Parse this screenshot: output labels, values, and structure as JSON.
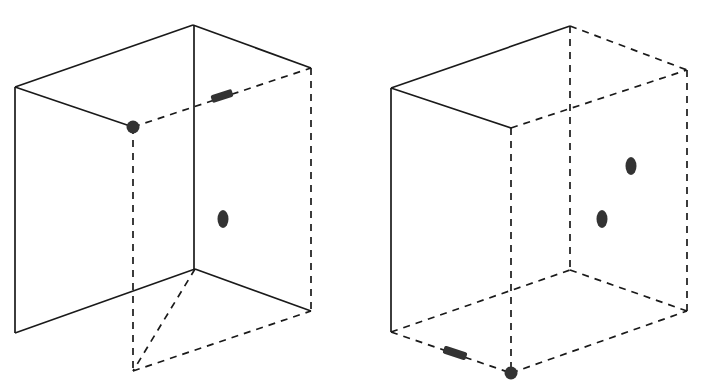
{
  "figure": {
    "title": "Two 3D wireframe rectangular boxes with point markers",
    "caption": "",
    "width": 712,
    "height": 392,
    "background_color": "#ffffff",
    "edge_color": "#1a1a1a",
    "marker_color": "#333333",
    "edge_stroke_width": 1.7,
    "dash_pattern": "7 6"
  },
  "panels": [
    {
      "id": "left-box",
      "label": "Left box",
      "description": "Wireframe box viewed from the left-front; near vertical edge at center, hidden back edges dashed",
      "vertices": {
        "top_front_left": [
          15,
          87
        ],
        "top_apex": [
          193,
          25
        ],
        "top_front_right": [
          311,
          68
        ],
        "top_back_hidden": [
          133,
          127
        ],
        "bottom_front_left": [
          17,
          333
        ],
        "bottom_apex": [
          195,
          269
        ],
        "bottom_front_right": [
          311,
          311
        ],
        "bottom_back_hidden": [
          133,
          371
        ]
      },
      "solid_edges": [
        [
          [
            15,
            87
          ],
          [
            193,
            25
          ]
        ],
        [
          [
            193,
            25
          ],
          [
            311,
            68
          ]
        ],
        [
          [
            15,
            87
          ],
          [
            133,
            127
          ]
        ],
        [
          [
            15,
            87
          ],
          [
            15,
            333
          ]
        ],
        [
          [
            193,
            25
          ],
          [
            195,
            269
          ]
        ],
        [
          [
            15,
            333
          ],
          [
            195,
            269
          ]
        ],
        [
          [
            195,
            269
          ],
          [
            311,
            311
          ]
        ],
        [
          [
            311,
            68
          ],
          [
            311,
            72
          ]
        ]
      ],
      "dashed_edges": [
        [
          [
            133,
            127
          ],
          [
            311,
            68
          ]
        ],
        [
          [
            133,
            127
          ],
          [
            133,
            371
          ]
        ],
        [
          [
            311,
            68
          ],
          [
            311,
            311
          ]
        ],
        [
          [
            195,
            269
          ],
          [
            133,
            371
          ]
        ],
        [
          [
            133,
            371
          ],
          [
            311,
            311
          ]
        ]
      ],
      "markers": [
        {
          "name": "corner-dot",
          "shape": "circle",
          "cx": 133,
          "cy": 127,
          "rx": 6.5,
          "ry": 6.5,
          "rotation": 0,
          "note": "round dot at hidden back-top corner"
        },
        {
          "name": "edge-dash-marker",
          "shape": "dash",
          "cx": 222,
          "cy": 96,
          "rx": 11,
          "ry": 4,
          "rotation": -18,
          "note": "thick short dash lying on the hidden top-back edge"
        },
        {
          "name": "interior-blob",
          "shape": "oval",
          "cx": 223,
          "cy": 219,
          "rx": 5.5,
          "ry": 9,
          "rotation": 0,
          "note": "oval blob inside right face"
        }
      ]
    },
    {
      "id": "right-box",
      "label": "Right box",
      "description": "Wireframe box viewed from the right-front; near vertical edge at left, hidden edges dashed, marked corner at bottom",
      "vertices": {
        "top_front_left": [
          391,
          88
        ],
        "top_apex": [
          570,
          26
        ],
        "top_front_right": [
          687,
          70
        ],
        "top_back_hidden": [
          511,
          128
        ],
        "bottom_front_left": [
          391,
          332
        ],
        "bottom_back_hidden": [
          511,
          373
        ],
        "bottom_front_right": [
          687,
          311
        ],
        "bottom_apex": [
          570,
          270
        ]
      },
      "solid_edges": [
        [
          [
            391,
            88
          ],
          [
            570,
            26
          ]
        ],
        [
          [
            391,
            88
          ],
          [
            511,
            128
          ]
        ],
        [
          [
            391,
            88
          ],
          [
            391,
            332
          ]
        ],
        [
          [
            511,
            128
          ],
          [
            570,
            107
          ]
        ]
      ],
      "dashed_edges": [
        [
          [
            570,
            26
          ],
          [
            687,
            70
          ]
        ],
        [
          [
            570,
            26
          ],
          [
            570,
            270
          ]
        ],
        [
          [
            511,
            128
          ],
          [
            687,
            70
          ]
        ],
        [
          [
            511,
            128
          ],
          [
            511,
            373
          ]
        ],
        [
          [
            687,
            70
          ],
          [
            687,
            311
          ]
        ],
        [
          [
            391,
            332
          ],
          [
            511,
            373
          ]
        ],
        [
          [
            511,
            373
          ],
          [
            687,
            311
          ]
        ],
        [
          [
            570,
            270
          ],
          [
            687,
            311
          ]
        ],
        [
          [
            391,
            332
          ],
          [
            570,
            270
          ]
        ]
      ],
      "markers": [
        {
          "name": "corner-dot",
          "shape": "circle",
          "cx": 511,
          "cy": 373,
          "rx": 6.5,
          "ry": 6.5,
          "rotation": 0,
          "note": "round dot at hidden bottom corner"
        },
        {
          "name": "edge-dash-marker",
          "shape": "dash",
          "cx": 455,
          "cy": 353,
          "rx": 12,
          "ry": 4,
          "rotation": 18,
          "note": "thick short dash lying on the hidden bottom-back edge"
        },
        {
          "name": "interior-blob-upper",
          "shape": "oval",
          "cx": 631,
          "cy": 166,
          "rx": 5.5,
          "ry": 9,
          "rotation": 0,
          "note": "upper oval blob inside right face"
        },
        {
          "name": "interior-blob-lower",
          "shape": "oval",
          "cx": 602,
          "cy": 219,
          "rx": 5.5,
          "ry": 9,
          "rotation": 0,
          "note": "lower oval blob inside right face"
        }
      ]
    }
  ],
  "chart_data": {
    "type": "diagram",
    "title": "Two 3D wireframe rectangular boxes with point markers",
    "xlabel": "",
    "ylabel": "",
    "legend": [],
    "annotations": [
      "left box: corner dot at hidden top-back vertex",
      "left box: dash marker on hidden top-back edge",
      "left box: one oval blob in interior",
      "right box: corner dot at hidden bottom vertex",
      "right box: dash marker on hidden bottom-back edge",
      "right box: two oval blobs in interior"
    ]
  }
}
